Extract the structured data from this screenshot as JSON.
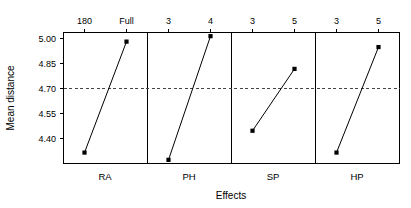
{
  "chart_data": {
    "type": "line",
    "title": "",
    "subtitle": "",
    "xlabel": "Effects",
    "ylabel": "Mean distance",
    "ylim": [
      4.33,
      5.05
    ],
    "yticks": [
      4.4,
      4.55,
      4.7,
      4.85,
      5.0
    ],
    "ytick_labels": [
      "4.40",
      "4.55",
      "4.70",
      "4.85",
      "5.00"
    ],
    "grid": false,
    "legend": "none",
    "reference_line": {
      "value": 4.7,
      "label": "",
      "style": "dashed",
      "color": "#444444"
    },
    "panel_axis_position": "top",
    "marker": "filled-square",
    "panels": [
      {
        "name": "RA",
        "levels": [
          "180",
          "Full"
        ],
        "values": [
          4.39,
          5.0
        ]
      },
      {
        "name": "PH",
        "levels": [
          "3",
          "4"
        ],
        "values": [
          4.35,
          5.03
        ]
      },
      {
        "name": "SP",
        "levels": [
          "3",
          "5"
        ],
        "values": [
          4.51,
          4.85
        ]
      },
      {
        "name": "HP",
        "levels": [
          "3",
          "5"
        ],
        "values": [
          4.39,
          4.97
        ]
      }
    ]
  },
  "axes": {
    "y_title": "Mean distance",
    "x_title": "Effects"
  },
  "ytick_labels": {
    "t0": "4.40",
    "t1": "4.55",
    "t2": "4.70",
    "t3": "4.85",
    "t4": "5.00"
  },
  "panel_names": {
    "p0": "RA",
    "p1": "PH",
    "p2": "SP",
    "p3": "HP"
  },
  "level_labels": {
    "p0l0": "180",
    "p0l1": "Full",
    "p1l0": "3",
    "p1l1": "4",
    "p2l0": "3",
    "p2l1": "5",
    "p3l0": "3",
    "p3l1": "5"
  },
  "colors": {
    "line": "#000000",
    "marker": "#000000",
    "reference": "#444444",
    "frame": "#000000",
    "background": "#ffffff"
  }
}
